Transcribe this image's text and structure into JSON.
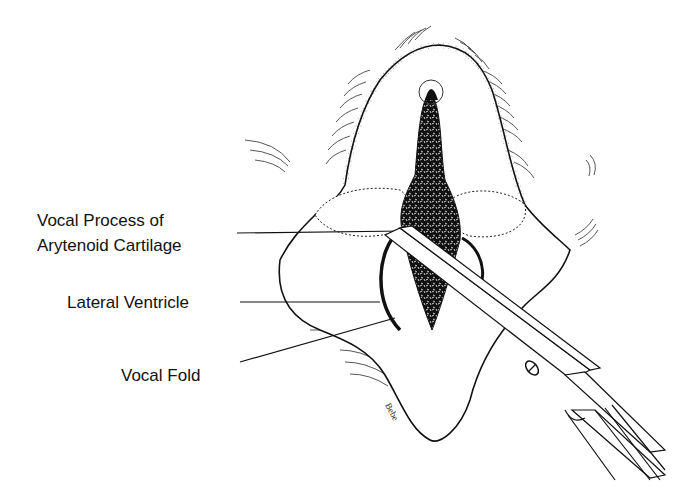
{
  "figure": {
    "labels": [
      {
        "id": "vocal-process",
        "line1": "Vocal Process of",
        "line2": "Arytenoid Cartilage"
      },
      {
        "id": "lateral-ventricle",
        "line1": "Lateral Ventricle"
      },
      {
        "id": "vocal-fold",
        "line1": "Vocal Fold"
      }
    ],
    "colors": {
      "ink": "#111111",
      "background": "#ffffff"
    }
  }
}
